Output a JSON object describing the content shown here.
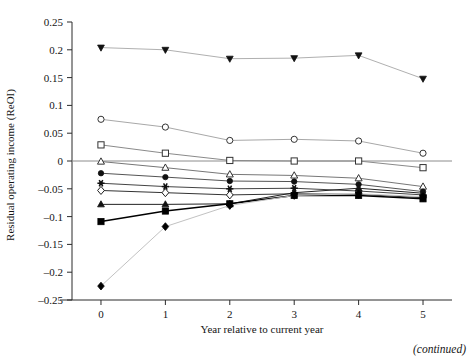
{
  "chart_data": {
    "type": "line",
    "title": "",
    "subtitle": "",
    "xlabel": "Year relative to current year",
    "ylabel": "Residual operating income (ReOI)",
    "x": [
      0,
      1,
      2,
      3,
      4,
      5
    ],
    "xlim": [
      -0.45,
      5.45
    ],
    "ylim": [
      -0.25,
      0.25
    ],
    "xticks": [
      "0",
      "1",
      "2",
      "3",
      "4",
      "5"
    ],
    "yticks": [
      "0.25",
      "0.2",
      "0.15",
      "0.1",
      "0.05",
      "0",
      "-0.05",
      "-0.1",
      "-0.15",
      "-0.2",
      "-0.25"
    ],
    "ytick_values": [
      0.25,
      0.2,
      0.15,
      0.1,
      0.05,
      0,
      -0.05,
      -0.1,
      -0.15,
      -0.2,
      -0.25
    ],
    "grid": false,
    "legend": "none",
    "zero_line": true,
    "annotations": [
      "(continued)"
    ],
    "series": [
      {
        "name": "Portfolio 10",
        "marker": "triangle-down-filled",
        "color": "#111111",
        "line_color": "#b0b0b0",
        "values": [
          0.204,
          0.2,
          0.184,
          0.185,
          0.19,
          0.148
        ]
      },
      {
        "name": "Portfolio 9",
        "marker": "circle-open",
        "color": "#333333",
        "line_color": "#a8a8a8",
        "values": [
          0.075,
          0.061,
          0.037,
          0.039,
          0.036,
          0.014
        ]
      },
      {
        "name": "Portfolio 8",
        "marker": "square-open",
        "color": "#333333",
        "line_color": "#8a8a8a",
        "values": [
          0.029,
          0.014,
          0.001,
          0.0,
          0.0,
          -0.012
        ]
      },
      {
        "name": "Portfolio 7",
        "marker": "triangle-up-open",
        "color": "#333333",
        "line_color": "#777777",
        "values": [
          -0.001,
          -0.012,
          -0.024,
          -0.026,
          -0.031,
          -0.046
        ]
      },
      {
        "name": "Portfolio 6",
        "marker": "circle-filled",
        "color": "#111111",
        "line_color": "#555555",
        "values": [
          -0.022,
          -0.029,
          -0.036,
          -0.037,
          -0.042,
          -0.055
        ]
      },
      {
        "name": "Portfolio 5",
        "marker": "star-filled",
        "color": "#111111",
        "line_color": "#444444",
        "values": [
          -0.04,
          -0.046,
          -0.05,
          -0.049,
          -0.054,
          -0.061
        ]
      },
      {
        "name": "Portfolio 4",
        "marker": "diamond-open",
        "color": "#222222",
        "line_color": "#333333",
        "values": [
          -0.053,
          -0.057,
          -0.061,
          -0.059,
          -0.06,
          -0.066
        ]
      },
      {
        "name": "Portfolio 3",
        "marker": "triangle-up-filled",
        "color": "#111111",
        "line_color": "#222222",
        "values": [
          -0.078,
          -0.078,
          -0.077,
          -0.057,
          -0.049,
          -0.058
        ]
      },
      {
        "name": "Portfolio 2",
        "marker": "square-filled",
        "color": "#000000",
        "line_color": "#000000",
        "values": [
          -0.109,
          -0.09,
          -0.077,
          -0.062,
          -0.062,
          -0.068
        ]
      },
      {
        "name": "Portfolio 1",
        "marker": "diamond-filled",
        "color": "#000000",
        "line_color": "#c2c2c2",
        "values": [
          -0.225,
          -0.118,
          -0.08,
          -0.062,
          -0.059,
          -0.064
        ]
      }
    ]
  },
  "figure": {
    "continued_label": "(continued)"
  }
}
